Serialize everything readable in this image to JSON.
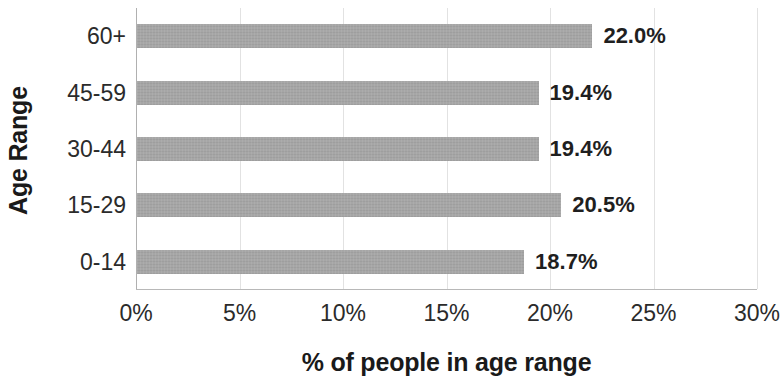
{
  "chart_data": {
    "type": "bar",
    "orientation": "horizontal",
    "title": "",
    "xlabel": "% of people in age range",
    "ylabel": "Age Range",
    "categories": [
      "0-14",
      "15-29",
      "30-44",
      "45-59",
      "60+"
    ],
    "values": [
      18.7,
      20.5,
      19.4,
      19.4,
      22.0
    ],
    "data_labels": [
      "18.7%",
      "20.5%",
      "19.4%",
      "19.4%",
      "22.0%"
    ],
    "xlim": [
      0,
      30
    ],
    "ylim": null,
    "x_ticks": [
      0,
      5,
      10,
      15,
      20,
      25,
      30
    ],
    "x_tick_labels": [
      "0%",
      "5%",
      "10%",
      "15%",
      "20%",
      "25%",
      "30%"
    ],
    "grid": "vertical",
    "legend": "none",
    "bar_color": "#a6a6a6",
    "text_color": "#1f1f1f",
    "gridline_color": "#e2e2e2",
    "axis_color": "#b0b0b0"
  }
}
